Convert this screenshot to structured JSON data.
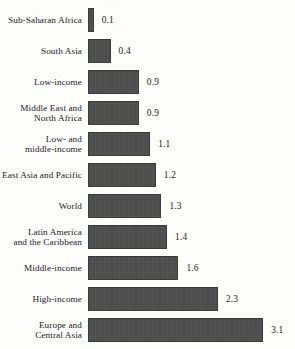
{
  "chart_data": {
    "type": "bar",
    "orientation": "horizontal",
    "title": "",
    "subtitle": "",
    "xlabel": "",
    "ylabel": "",
    "grid": false,
    "legend": null,
    "axis_origin_value": 0,
    "xlim": [
      0,
      3.1
    ],
    "categories": [
      "Sub-Saharan Africa",
      "South Asia",
      "Low-income",
      "Middle East and\nNorth Africa",
      "Low- and\nmiddle-income",
      "East Asia and Pacific",
      "World",
      "Latin America\nand the Caribbean",
      "Middle-income",
      "High-income",
      "Europe and\nCentral Asia"
    ],
    "values": [
      0.1,
      0.4,
      0.9,
      0.9,
      1.1,
      1.2,
      1.3,
      1.4,
      1.6,
      2.3,
      3.1
    ],
    "value_labels": [
      "0.1",
      "0.4",
      "0.9",
      "0.9",
      "1.1",
      "1.2",
      "1.3",
      "1.4",
      "1.6",
      "2.3",
      "3.1"
    ],
    "bar_color": "#4a4a4a",
    "bar_border_color": "#3b3b3b",
    "background_color": "#fdfdfb",
    "text_color": "#25211f"
  }
}
